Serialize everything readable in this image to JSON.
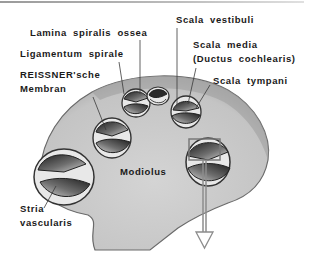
{
  "figure": {
    "type": "anatomical cross-section",
    "colors": {
      "bone_fill": "#c8c8c8",
      "bone_edge": "#8a8a8a",
      "chamber_dark": "#2a2a2a",
      "chamber_mid": "#7a7a7a",
      "line": "#3a3a3a",
      "arrow": "#8c8c8c",
      "text": "#1a1a1a",
      "background": "#ffffff"
    }
  },
  "labels": {
    "lamina_spiralis_ossea": "Lamina spiralis ossea",
    "ligamentum_spirale": "Ligamentum spirale",
    "reissner_line1": "REISSNER'sche",
    "reissner_line2": "Membran",
    "scala_vestibuli": "Scala vestibuli",
    "scala_media_line1": "Scala media",
    "scala_media_line2": "(Ductus cochlearis)",
    "scala_tympani": "Scala tympani",
    "modiolus": "Modiolus",
    "stria_line1": "Stria",
    "stria_line2": "vascularis"
  },
  "callout": {
    "detail_box": "magnified region indicator",
    "arrow_direction": "down"
  }
}
